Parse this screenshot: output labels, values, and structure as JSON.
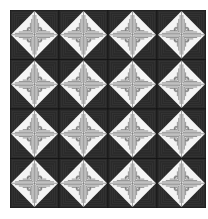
{
  "pattern": {
    "name": "log-cabin-diamond-quilt",
    "rows": 4,
    "cols": 4,
    "colors": {
      "dark": "#2a2a2a",
      "light": "#f4f4f4",
      "line": "#555555"
    }
  }
}
